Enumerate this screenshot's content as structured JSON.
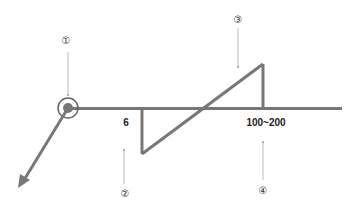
{
  "diagram": {
    "line_color": "#777777",
    "guide_color": "#bbbbbb",
    "labels": {
      "left_value": "6",
      "right_value": "100~200"
    },
    "markers": [
      {
        "id": "1",
        "glyph": "①",
        "x": 66,
        "y": 40
      },
      {
        "id": "2",
        "glyph": "②",
        "x": 125,
        "y": 193
      },
      {
        "id": "3",
        "glyph": "③",
        "x": 238,
        "y": 19
      },
      {
        "id": "4",
        "glyph": "④",
        "x": 263,
        "y": 190
      }
    ]
  }
}
